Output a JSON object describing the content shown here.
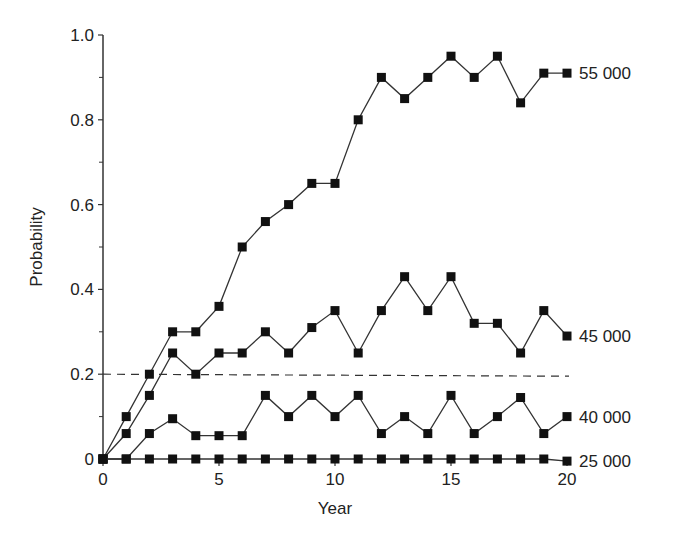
{
  "chart_data": {
    "type": "line",
    "title": "",
    "xlabel": "Year",
    "ylabel": "Probability",
    "xlim": [
      0,
      20
    ],
    "ylim": [
      0,
      1.0
    ],
    "x_ticks": [
      0,
      5,
      10,
      15,
      20
    ],
    "x_tick_labels": [
      "0",
      "5",
      "10",
      "15",
      "20"
    ],
    "y_ticks": [
      0,
      0.2,
      0.4,
      0.6,
      0.8,
      1.0
    ],
    "y_tick_labels": [
      "0",
      "0.2",
      "0.4",
      "0.6",
      "0.8",
      "1.0"
    ],
    "y_minor_ticks": [
      0.1,
      0.3,
      0.5,
      0.7,
      0.9
    ],
    "grid": false,
    "legend_position": "inline-right",
    "reference_line": {
      "y": 0.2,
      "style": "dashed",
      "x_range": [
        0,
        20
      ]
    },
    "marker": "filled-square",
    "x": [
      0,
      1,
      2,
      3,
      4,
      5,
      6,
      7,
      8,
      9,
      10,
      11,
      12,
      13,
      14,
      15,
      16,
      17,
      18,
      19,
      20
    ],
    "series": [
      {
        "name": "55 000",
        "values": [
          0,
          0.1,
          0.2,
          0.3,
          0.3,
          0.36,
          0.5,
          0.56,
          0.6,
          0.65,
          0.65,
          0.8,
          0.9,
          0.85,
          0.9,
          0.95,
          0.9,
          0.95,
          0.84,
          0.91,
          0.91
        ]
      },
      {
        "name": "45 000",
        "values": [
          0,
          0.06,
          0.15,
          0.25,
          0.2,
          0.25,
          0.25,
          0.3,
          0.25,
          0.31,
          0.35,
          0.25,
          0.35,
          0.43,
          0.35,
          0.43,
          0.32,
          0.32,
          0.25,
          0.35,
          0.29
        ]
      },
      {
        "name": "40 000",
        "values": [
          0,
          0,
          0.06,
          0.095,
          0.055,
          0.055,
          0.055,
          0.15,
          0.1,
          0.15,
          0.1,
          0.15,
          0.06,
          0.1,
          0.06,
          0.15,
          0.06,
          0.1,
          0.145,
          0.06,
          0.1
        ]
      },
      {
        "name": "25 000",
        "values": [
          0,
          0,
          0,
          0,
          0,
          0,
          0,
          0,
          0,
          0,
          0,
          0,
          0,
          0,
          0,
          0,
          0,
          0,
          0,
          0,
          -0.005
        ]
      }
    ]
  },
  "colors": {
    "line": "#333333",
    "marker": "#111111",
    "axis": "#333333",
    "text": "#222222"
  }
}
